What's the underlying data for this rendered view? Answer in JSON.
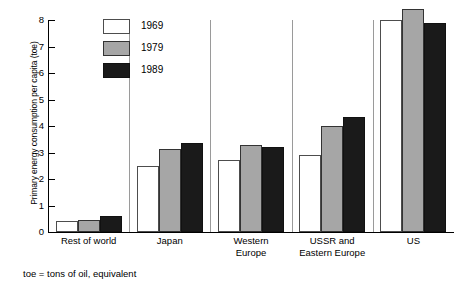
{
  "chart_data": {
    "type": "bar",
    "title": "",
    "xlabel": "",
    "ylabel": "Primary energy consumption per capita (toe)",
    "ylim": [
      0,
      8
    ],
    "yticks": [
      0,
      1,
      2,
      3,
      4,
      5,
      6,
      7,
      8
    ],
    "ytick_labels": [
      "0",
      "1",
      "2",
      "3",
      "4",
      "5",
      "6",
      "7",
      "8"
    ],
    "grid": false,
    "legend_position": "top-left-inside",
    "categories": [
      "Rest of world",
      "Japan",
      "Western Europe",
      "USSR and Eastern Europe",
      "US"
    ],
    "category_lines": [
      [
        "Rest of world"
      ],
      [
        "Japan"
      ],
      [
        "Western",
        "Europe"
      ],
      [
        "USSR and",
        "Eastern Europe"
      ],
      [
        "US"
      ]
    ],
    "series": [
      {
        "name": "1969",
        "color": "#ffffff",
        "values": [
          0.4,
          2.5,
          2.7,
          2.9,
          8.0
        ]
      },
      {
        "name": "1979",
        "color": "#a6a6a6",
        "values": [
          0.45,
          3.15,
          3.3,
          4.0,
          8.4
        ]
      },
      {
        "name": "1989",
        "color": "#1a1a1a",
        "values": [
          0.6,
          3.35,
          3.2,
          4.35,
          7.9
        ]
      }
    ],
    "footnote": "toe = tons of oil, equivalent"
  }
}
